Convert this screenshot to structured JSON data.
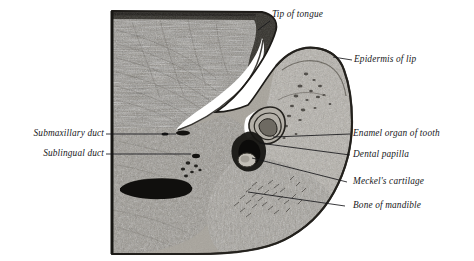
{
  "figure": {
    "style": "engraving",
    "background_color": "#ffffff",
    "ink_color": "#17171a",
    "tissue_light": "#b9b5ad",
    "tissue_mid": "#8d8881",
    "tissue_dark": "#3a3732",
    "cavity_color": "#ffffff"
  },
  "labels": {
    "tip_of_tongue": {
      "text": "Tip of tongue",
      "side": "right",
      "x": 272,
      "y": 9,
      "leader": {
        "x1": 270,
        "y1": 21,
        "x2": 258,
        "y2": 30
      }
    },
    "epidermis_of_lip": {
      "text": "Epidermis of lip",
      "side": "right",
      "x": 354,
      "y": 54,
      "leader": {
        "x1": 352,
        "y1": 60,
        "x2": 333,
        "y2": 57
      }
    },
    "submaxillary_duct": {
      "text": "Submaxillary duct",
      "side": "left",
      "x": 12,
      "y": 128,
      "leader": {
        "x1": 106,
        "y1": 134,
        "x2": 176,
        "y2": 134
      }
    },
    "sublingual_duct": {
      "text": "Sublingual duct",
      "side": "left",
      "x": 12,
      "y": 148,
      "leader": {
        "x1": 106,
        "y1": 154,
        "x2": 187,
        "y2": 154
      }
    },
    "enamel_organ_of_tooth": {
      "text": "Enamel organ of tooth",
      "side": "right",
      "x": 353,
      "y": 128,
      "leader": {
        "x1": 350,
        "y1": 134,
        "x2": 273,
        "y2": 137
      }
    },
    "dental_papilla": {
      "text": "Dental papilla",
      "side": "right",
      "x": 353,
      "y": 149,
      "leader": {
        "x1": 350,
        "y1": 155,
        "x2": 259,
        "y2": 143
      }
    },
    "meckels_cartilage": {
      "text": "Meckel's cartilage",
      "side": "right",
      "x": 353,
      "y": 176,
      "leader": {
        "x1": 347,
        "y1": 182,
        "x2": 252,
        "y2": 158
      }
    },
    "bone_of_mandible": {
      "text": "Bone of mandible",
      "side": "right",
      "x": 353,
      "y": 200,
      "leader": {
        "x1": 345,
        "y1": 206,
        "x2": 248,
        "y2": 192
      }
    }
  },
  "regions": [
    {
      "name": "tongue-body",
      "label": "Tongue"
    },
    {
      "name": "oral-cavity",
      "label": "Oral cavity"
    },
    {
      "name": "lip",
      "label": "Lip"
    },
    {
      "name": "enamel-organ",
      "label": "Enamel organ"
    },
    {
      "name": "dental-papilla",
      "label": "Dental papilla"
    },
    {
      "name": "mandible",
      "label": "Mandible"
    },
    {
      "name": "submaxillary-duct-lumen",
      "label": "Submaxillary duct lumen"
    },
    {
      "name": "sublingual-duct-lumen",
      "label": "Sublingual duct lumen"
    },
    {
      "name": "large-duct-lumen",
      "label": "Large duct lumen"
    }
  ]
}
